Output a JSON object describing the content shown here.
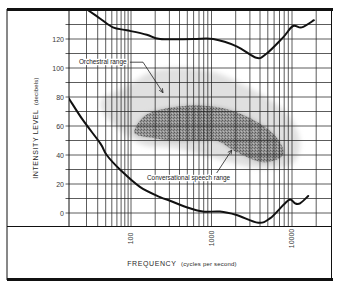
{
  "axes": {
    "x": {
      "label": "FREQUENCY",
      "unit": "(cycles per second)"
    },
    "y": {
      "label": "INTENSITY LEVEL",
      "unit": "(decibels)"
    }
  },
  "chart_data": {
    "type": "line",
    "title": "",
    "xlabel": "FREQUENCY (cycles per second)",
    "ylabel": "INTENSITY LEVEL (decibels)",
    "xscale": "log",
    "xlim": [
      10.6,
      30000
    ],
    "ylim": [
      -9,
      140
    ],
    "grid": true,
    "legend": null,
    "x_ticks": [
      100,
      1000,
      10000
    ],
    "x_tick_labels": [
      "100",
      "1000",
      "10000"
    ],
    "y_ticks": [
      0,
      20,
      40,
      60,
      80,
      100,
      120
    ],
    "y_tick_labels": [
      "0",
      "20",
      "40",
      "60",
      "80",
      "100",
      "120"
    ],
    "x_grid": [
      20,
      30,
      40,
      50,
      60,
      70,
      80,
      90,
      100,
      200,
      300,
      400,
      500,
      600,
      700,
      800,
      900,
      1000,
      2000,
      3000,
      4000,
      5000,
      6000,
      7000,
      8000,
      9000,
      10000,
      20000
    ],
    "y_grid": [
      0,
      10,
      20,
      30,
      40,
      50,
      60,
      70,
      80,
      90,
      100,
      110,
      120,
      130
    ],
    "series": [
      {
        "name": "upper boundary curve",
        "x": [
          21,
          33,
          52,
          86,
          157,
          230,
          590,
          1050,
          2050,
          3600,
          4850,
          7700,
          10300,
          13200,
          18700
        ],
        "y": [
          140,
          134,
          128,
          126,
          123,
          120,
          120,
          120,
          115,
          107,
          110,
          121,
          129,
          128,
          133
        ]
      },
      {
        "name": "lower boundary curve",
        "x": [
          10.6,
          17.6,
          33,
          41.5,
          67,
          129,
          230,
          305,
          490,
          780,
          1275,
          2050,
          3800,
          5330,
          7800,
          9440,
          10900,
          12600,
          15900
        ],
        "y": [
          79,
          64,
          48,
          40,
          30,
          18,
          11,
          8.5,
          4,
          1,
          1,
          -1.4,
          -6.7,
          -3.7,
          5.5,
          9.4,
          6.7,
          6.7,
          11.7
        ]
      }
    ],
    "regions": [
      {
        "label": "Orchestral range",
        "shade": "light",
        "color": "#e0e0e0",
        "points": [
          [
            36,
            79
          ],
          [
            75,
            86
          ],
          [
            172,
            97
          ],
          [
            332,
            100
          ],
          [
            783,
            99
          ],
          [
            1390,
            95
          ],
          [
            3010,
            86
          ],
          [
            6460,
            75
          ],
          [
            10280,
            63
          ],
          [
            12560,
            47
          ],
          [
            9440,
            33
          ],
          [
            3640,
            31
          ],
          [
            1700,
            35
          ],
          [
            783,
            40
          ],
          [
            332,
            45
          ],
          [
            141,
            47
          ],
          [
            60,
            59
          ],
          [
            36,
            70
          ]
        ]
      },
      {
        "label": "Conversational speech range",
        "shade": "dark",
        "color": "#8c8c8c",
        "points": [
          [
            112,
            58
          ],
          [
            157,
            68
          ],
          [
            332,
            73
          ],
          [
            783,
            74
          ],
          [
            1700,
            71
          ],
          [
            3640,
            63
          ],
          [
            6460,
            52
          ],
          [
            7730,
            40
          ],
          [
            4360,
            35
          ],
          [
            2055,
            42
          ],
          [
            1160,
            50
          ],
          [
            719,
            50
          ],
          [
            332,
            50
          ],
          [
            172,
            52
          ],
          [
            118,
            54
          ]
        ]
      }
    ],
    "annotations": [
      {
        "text": "Orchestral range",
        "anchor": [
          15.2,
          102.5
        ],
        "leader": [
          [
            96,
            104
          ],
          [
            141,
            104
          ],
          [
            250,
            83
          ]
        ]
      },
      {
        "text": "Conversational speech range",
        "anchor": [
          158,
          22.5
        ],
        "leader": [
          [
            1160,
            27.6
          ],
          [
            1780,
            43.4
          ]
        ]
      }
    ]
  }
}
